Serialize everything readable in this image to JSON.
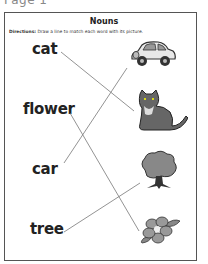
{
  "page": {
    "label": "Page 1"
  },
  "worksheet": {
    "title": "Nouns",
    "directions_label": "Directions:",
    "directions_text": " Draw a line to match each word with its picture."
  },
  "words": [
    {
      "text": "cat"
    },
    {
      "text": "flower"
    },
    {
      "text": "car"
    },
    {
      "text": "tree"
    }
  ],
  "pictures": [
    "car-icon",
    "cat-icon",
    "tree-icon",
    "flower-icon"
  ],
  "matches": [
    {
      "word": "cat",
      "picture": "cat"
    },
    {
      "word": "flower",
      "picture": "flower"
    },
    {
      "word": "car",
      "picture": "car"
    },
    {
      "word": "tree",
      "picture": "tree"
    }
  ]
}
